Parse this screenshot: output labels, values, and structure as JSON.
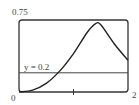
{
  "chart_data": {
    "type": "line",
    "title": "",
    "xlabel": "",
    "ylabel": "",
    "xlim": [
      0,
      2
    ],
    "ylim": [
      0,
      0.75
    ],
    "grid": false,
    "x_tick_labels": [
      "0",
      "2"
    ],
    "x_ticks": [
      0,
      1,
      2
    ],
    "y_tick_labels": [
      "0.75"
    ],
    "series": [
      {
        "name": "f(x)",
        "x": [
          0,
          0.25,
          0.5,
          0.75,
          1.0,
          1.25,
          1.4,
          1.5,
          1.75,
          2.0
        ],
        "values": [
          0,
          0.02,
          0.09,
          0.22,
          0.4,
          0.62,
          0.71,
          0.7,
          0.5,
          0.33
        ]
      }
    ],
    "annotations": [
      {
        "type": "hline",
        "y": 0.2,
        "label": "y = 0.2"
      }
    ]
  },
  "labels": {
    "y_max": "0.75",
    "x_min": "0",
    "x_max": "2",
    "hline": "y = 0.2"
  },
  "colors": {
    "curve": "#222222",
    "frame": "#333333",
    "hline": "#444444"
  }
}
